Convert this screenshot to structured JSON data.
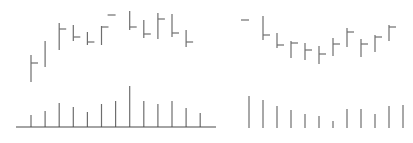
{
  "colors": {
    "bar": "#6e6e6e",
    "axis": "#4a4a4a",
    "background": "#ffffff"
  },
  "chart_data": [
    {
      "type": "ohlc",
      "panel": "left",
      "title": "",
      "xlabel": "",
      "ylabel": "",
      "grid": false,
      "legend": null,
      "note": "Price values are in relative units (higher = up); no axis ticks or labels are shown.",
      "x": [
        1,
        2,
        3,
        4,
        5,
        6,
        7,
        8,
        9,
        10,
        11,
        12,
        13
      ],
      "bars": [
        {
          "x": 1,
          "high": 45,
          "low": 18,
          "open": null,
          "close": 37
        },
        {
          "x": 2,
          "high": 59,
          "low": 33,
          "open": null,
          "close": null
        },
        {
          "x": 3,
          "high": 77,
          "low": 50,
          "open": null,
          "close": 71
        },
        {
          "x": 4,
          "high": 75,
          "low": 59,
          "open": null,
          "close": 63
        },
        {
          "x": 5,
          "high": 68,
          "low": 55,
          "open": null,
          "close": 58
        },
        {
          "x": 6,
          "high": 74,
          "low": 55,
          "open": null,
          "close": 73
        },
        {
          "x": 7,
          "high": null,
          "low": null,
          "open": 85,
          "close": null
        },
        {
          "x": 8,
          "high": 89,
          "low": 70,
          "open": null,
          "close": 73
        },
        {
          "x": 9,
          "high": 80,
          "low": 62,
          "open": null,
          "close": 66
        },
        {
          "x": 10,
          "high": 87,
          "low": 61,
          "open": null,
          "close": 81
        },
        {
          "x": 11,
          "high": 86,
          "low": 63,
          "open": null,
          "close": 67
        },
        {
          "x": 12,
          "high": 70,
          "low": 53,
          "open": null,
          "close": 58
        }
      ],
      "volume": [
        12,
        16,
        24,
        20,
        15,
        23,
        26,
        41,
        26,
        23,
        26,
        19,
        14
      ],
      "has_baseline_axis": true
    },
    {
      "type": "ohlc",
      "panel": "right",
      "title": "",
      "xlabel": "",
      "ylabel": "",
      "grid": false,
      "legend": null,
      "note": "Price values are in relative units (higher = up); no axis ticks or labels are shown.",
      "x": [
        1,
        2,
        3,
        4,
        5,
        6,
        7,
        8,
        9,
        10,
        11,
        12
      ],
      "bars": [
        {
          "x": 1,
          "high": null,
          "low": null,
          "open": 80,
          "close": null
        },
        {
          "x": 2,
          "high": 84,
          "low": 60,
          "open": null,
          "close": 65
        },
        {
          "x": 3,
          "high": 67,
          "low": 52,
          "open": null,
          "close": 55
        },
        {
          "x": 4,
          "high": 59,
          "low": 42,
          "open": null,
          "close": 57
        },
        {
          "x": 5,
          "high": 57,
          "low": 40,
          "open": null,
          "close": 50
        },
        {
          "x": 6,
          "high": 54,
          "low": 36,
          "open": null,
          "close": 46
        },
        {
          "x": 7,
          "high": 62,
          "low": 44,
          "open": null,
          "close": 56
        },
        {
          "x": 8,
          "high": 72,
          "low": 53,
          "open": null,
          "close": 68
        },
        {
          "x": 9,
          "high": 61,
          "low": 43,
          "open": null,
          "close": 56
        },
        {
          "x": 10,
          "high": 65,
          "low": 48,
          "open": null,
          "close": 63
        },
        {
          "x": 11,
          "high": 75,
          "low": 59,
          "open": null,
          "close": 73
        }
      ],
      "volume": [
        32,
        28,
        22,
        18,
        14,
        12,
        7,
        19,
        19,
        14,
        22,
        23
      ],
      "has_baseline_axis": false
    }
  ]
}
